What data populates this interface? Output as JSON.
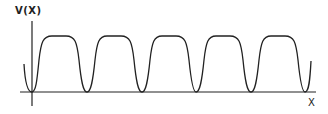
{
  "diagram": {
    "y_axis_label": "V(X)",
    "x_axis_label": "X",
    "stroke_color": "#222222",
    "background": "#ffffff",
    "num_wells": 6,
    "num_barriers": 5
  }
}
